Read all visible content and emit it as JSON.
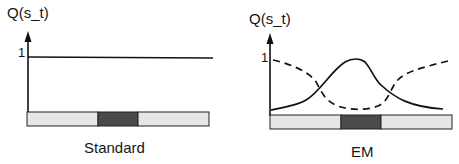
{
  "panels": [
    {
      "id": "standard",
      "caption": "Standard",
      "y_axis_label": "Q(s_t)",
      "y_tick": "1",
      "curves": [
        {
          "name": "constant",
          "style": "solid",
          "description": "flat line at Q=1"
        }
      ],
      "bar": {
        "segments": [
          "light",
          "dark",
          "light"
        ]
      }
    },
    {
      "id": "em",
      "caption": "EM",
      "y_axis_label": "Q(s_t)",
      "y_tick": "1",
      "curves": [
        {
          "name": "bump",
          "style": "solid",
          "description": "low at edges, peaks near 1 over dark segment"
        },
        {
          "name": "dip",
          "style": "dashed",
          "description": "near 1 at edges, dips low over dark segment"
        }
      ],
      "bar": {
        "segments": [
          "light",
          "dark",
          "light"
        ]
      }
    }
  ],
  "colors": {
    "line": "#111111",
    "bar_light": "#e6e6e6",
    "bar_dark": "#4a4a4a",
    "bar_border": "#222222"
  }
}
